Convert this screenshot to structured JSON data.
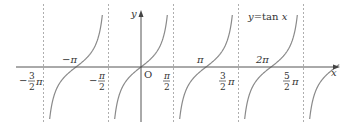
{
  "chart_data": {
    "type": "line",
    "function": "tan",
    "xlabel": "x",
    "ylabel": "y",
    "origin_label": "O",
    "curve_label": "y=tan x",
    "x_range_pi": [
      -1.55,
      3.05
    ],
    "y_clip": [
      -3.4,
      3.4
    ],
    "zeros": [
      {
        "label": "−π",
        "x_pi": -1
      },
      {
        "label": "π",
        "x_pi": 1
      },
      {
        "label": "2π",
        "x_pi": 2
      }
    ],
    "asymptotes": [
      {
        "label": "−3/2 π",
        "x_pi": -1.5
      },
      {
        "label": "−π/2",
        "x_pi": -0.5
      },
      {
        "label": "π/2",
        "x_pi": 0.5
      },
      {
        "label": "3/2 π",
        "x_pi": 1.5
      },
      {
        "label": "5/2 π",
        "x_pi": 2.5
      }
    ],
    "grid": false,
    "colors": {
      "curve": "#8a8a8a",
      "axis": "#555555",
      "asymptote": "#999999"
    }
  }
}
